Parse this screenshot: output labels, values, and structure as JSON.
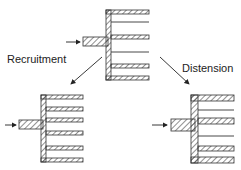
{
  "diagram": {
    "labels": {
      "left": "Recruitment",
      "right": "Distension"
    },
    "colors": {
      "ink": "#333333",
      "background": "#ffffff"
    },
    "panels": [
      {
        "name": "baseline",
        "description": "two perfused channels, one collapsed"
      },
      {
        "name": "recruitment",
        "description": "all channels perfused, same width"
      },
      {
        "name": "distension",
        "description": "perfused channels widened"
      }
    ]
  }
}
